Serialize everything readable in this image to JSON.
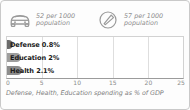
{
  "stats": [
    {
      "icon": "car-icon",
      "value_line": "52 per 1000",
      "unit_line": "population"
    },
    {
      "icon": "telephone-icon",
      "value_line": "57 per 1000",
      "unit_line": "population"
    }
  ],
  "chart_data": {
    "type": "bar",
    "orientation": "horizontal",
    "title": "",
    "categories": [
      "Defense",
      "Education",
      "Health"
    ],
    "values": [
      0.8,
      2,
      2.1
    ],
    "data_labels": [
      "Defense 0.8%",
      "Education 2%",
      "Health 2.1%"
    ],
    "bar_colors": [
      "#6b6b6b",
      "#9e9e9e",
      "#8d8d8d"
    ],
    "xlabel": "",
    "ylabel": "",
    "xlim": [
      0,
      25
    ],
    "xticks": [
      0,
      5,
      10,
      15,
      20,
      25
    ],
    "xtick_labels": [
      "0",
      "5",
      "10",
      "15",
      "20",
      "25"
    ],
    "grid": true,
    "legend": false,
    "caption": "Defense, Health, Education spending as % of GDP"
  }
}
